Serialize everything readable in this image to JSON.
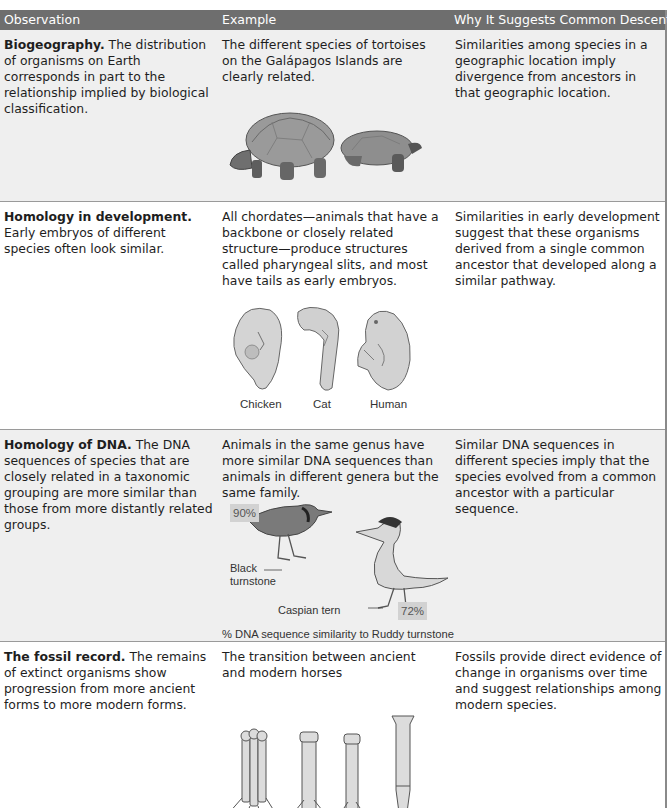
{
  "table": {
    "headers": {
      "observation": "Observation",
      "example": "Example",
      "why": "Why It Suggests Common Descent"
    },
    "colors": {
      "header_bg": "#6e6e6e",
      "header_text": "#ffffff",
      "row_gray": "#efefef",
      "row_white": "#ffffff",
      "highlight_box": "#d2d2d2"
    },
    "rows": [
      {
        "observation_title": "Biogeography.",
        "observation_text": " The distribution of organisms on Earth corresponds in part to the relationship implied by biological classification.",
        "example_text": "The different species of tortoises on the Galápagos Islands are clearly related.",
        "why_text": "Similarities among species in a geographic location imply divergence from ancestors in that geographic location.",
        "figure": "tortoises-illustration"
      },
      {
        "observation_title": "Homology in development.",
        "observation_text": " Early embryos of different species often look similar.",
        "example_text": "All chordates—animals that have a backbone or closely related structure—produce structures called pharyngeal slits, and most have tails as early embryos.",
        "why_text": "Similarities in early development suggest that these organisms derived from a single common ancestor that developed along a similar pathway.",
        "figure": "embryos-illustration",
        "figure_labels": [
          "Chicken",
          "Cat",
          "Human"
        ]
      },
      {
        "observation_title": "Homology of DNA.",
        "observation_text": " The DNA sequences of species that are closely related in a taxonomic grouping are more similar than those from more distantly related groups.",
        "example_text": "Animals in the same genus have more similar DNA sequences than animals in different genera but the same family.",
        "why_text": "Similar DNA sequences in different species imply that the species evolved from a common ancestor with a particular sequence.",
        "figure": "birds-illustration",
        "figure_labels": {
          "black_turnstone": "Black turnstone",
          "black_turnstone_pct": "90%",
          "caspian_tern": "Caspian tern",
          "caspian_tern_pct": "72%",
          "caption": "% DNA sequence similarity to Ruddy turnstone"
        }
      },
      {
        "observation_title": "The fossil record.",
        "observation_text": " The remains of extinct organisms show progression from more ancient forms to more modern forms.",
        "example_text": "The transition between ancient and modern horses",
        "why_text": "Fossils provide direct evidence of change in organisms over time and suggest relationships among modern species.",
        "figure": "horse-leg-bones-illustration"
      }
    ]
  }
}
